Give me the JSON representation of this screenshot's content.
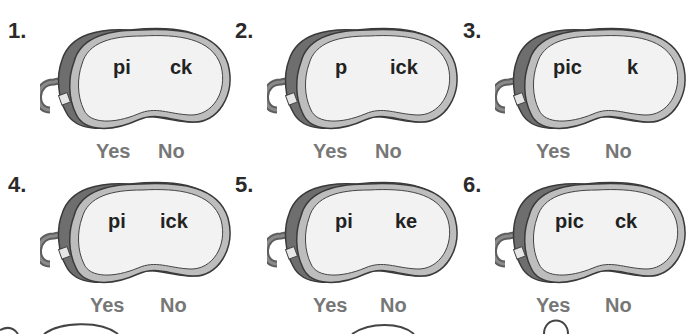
{
  "worksheet": {
    "items": [
      {
        "number": "1.",
        "left": "pi",
        "right": "ck",
        "yes": "Yes",
        "no": "No"
      },
      {
        "number": "2.",
        "left": "p",
        "right": "ick",
        "yes": "Yes",
        "no": "No"
      },
      {
        "number": "3.",
        "left": "pic",
        "right": "k",
        "yes": "Yes",
        "no": "No"
      },
      {
        "number": "4.",
        "left": "pi",
        "right": "ick",
        "yes": "Yes",
        "no": "No"
      },
      {
        "number": "5.",
        "left": "pi",
        "right": "ke",
        "yes": "Yes",
        "no": "No"
      },
      {
        "number": "6.",
        "left": "pic",
        "right": "ck",
        "yes": "Yes",
        "no": "No"
      }
    ]
  },
  "colors": {
    "text": "#222222",
    "answer": "#777777",
    "mask_strap": "#6e6e6e",
    "mask_rim": "#bdbdbd",
    "mask_face": "#f2f2f2"
  }
}
